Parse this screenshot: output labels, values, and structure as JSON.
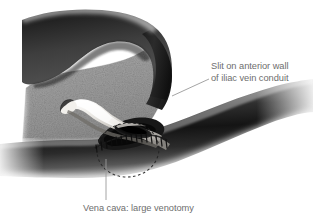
{
  "figure": {
    "type": "medical-illustration",
    "background_color": "#ffffff"
  },
  "labels": {
    "slit": {
      "line1": "Slit on anterior wall",
      "line2": "of iliac vein conduit"
    },
    "vena_cava": {
      "text": "Vena cava: large venotomy"
    }
  },
  "colors": {
    "text": "#6e6e6e",
    "leader_line": "#8c8c8c",
    "flap_dark": "#3b3b3b",
    "tissue_gray": "#9a9a9a",
    "vessel_dark": "#2c2c2c",
    "conduit_light": "#e8e6e2",
    "suture": "#1a1a1a",
    "dashed_outline": "#2a2a2a"
  },
  "structures": [
    {
      "name": "retractor-flap",
      "description": "dark curved tissue flap upper region"
    },
    {
      "name": "tissue-field",
      "description": "stippled gray tissue bed"
    },
    {
      "name": "iliac-vein-conduit",
      "description": "light curved conduit with anterior slit"
    },
    {
      "name": "anterior-slit",
      "description": "dark elongated opening in conduit"
    },
    {
      "name": "vena-cava",
      "description": "large dark vessel running lower right to lower left"
    },
    {
      "name": "suture-line",
      "description": "running stitches along anastomosis"
    },
    {
      "name": "venotomy-outline",
      "description": "dashed ellipse marking large venotomy"
    }
  ]
}
